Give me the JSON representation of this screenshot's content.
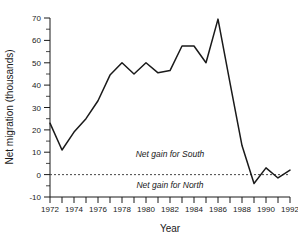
{
  "chart_data": {
    "type": "line",
    "title": "",
    "xlabel": "Year",
    "ylabel": "Net migration (thousands)",
    "xlim": [
      1972,
      1992
    ],
    "ylim": [
      -10,
      70
    ],
    "grid": false,
    "legend": null,
    "x": [
      1972,
      1973,
      1974,
      1975,
      1976,
      1977,
      1978,
      1979,
      1980,
      1981,
      1982,
      1983,
      1984,
      1985,
      1986,
      1987,
      1988,
      1989,
      1990,
      1991,
      1992
    ],
    "series": [
      {
        "name": "Net migration",
        "values": [
          23,
          11,
          19,
          25,
          33,
          44.5,
          50,
          45,
          50,
          45.5,
          46.5,
          57.5,
          57.5,
          50,
          69.5,
          41,
          13,
          -4,
          3,
          -1.5,
          2
        ]
      }
    ],
    "xticklabels": [
      "1972",
      "1974",
      "1976",
      "1978",
      "1980",
      "1982",
      "1984",
      "1986",
      "1988",
      "1990",
      "1992"
    ],
    "xtickvalues": [
      1972,
      1974,
      1976,
      1978,
      1980,
      1982,
      1984,
      1986,
      1988,
      1990,
      1992
    ],
    "yticklabels": [
      "-10",
      "0",
      "10",
      "20",
      "30",
      "40",
      "50",
      "60",
      "70"
    ],
    "ytickvalues": [
      -10,
      0,
      10,
      20,
      30,
      40,
      50,
      60,
      70
    ],
    "annotations": [
      {
        "text": "Net gain for South",
        "x": 1982,
        "y": 8
      },
      {
        "text": "Net gain for North",
        "x": 1982,
        "y": -6
      }
    ],
    "reference_line": {
      "y": 0,
      "style": "dashed",
      "color": "#444444"
    },
    "line_color": "#1a1a1a"
  },
  "axis": {
    "y_title": "Net migration (thousands)",
    "x_title": "Year",
    "y_labels": [
      "70",
      "60",
      "50",
      "40",
      "30",
      "20",
      "10",
      "0",
      "-10"
    ],
    "x_labels": [
      "1972",
      "1974",
      "1976",
      "1978",
      "1980",
      "1982",
      "1984",
      "1986",
      "1988",
      "1990",
      "1992"
    ]
  },
  "annotations": {
    "south": "Net gain for South",
    "north": "Net gain for North"
  }
}
